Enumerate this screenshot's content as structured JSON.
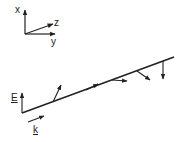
{
  "diagram": {
    "type": "wave-polarization-sketch",
    "axes": {
      "x_label": "x",
      "y_label": "y",
      "z_label": "z"
    },
    "field_label": "E",
    "wavevector_label": "k",
    "colors": {
      "stroke": "#222222",
      "background": "#ffffff"
    },
    "field_vectors_count": 6
  }
}
